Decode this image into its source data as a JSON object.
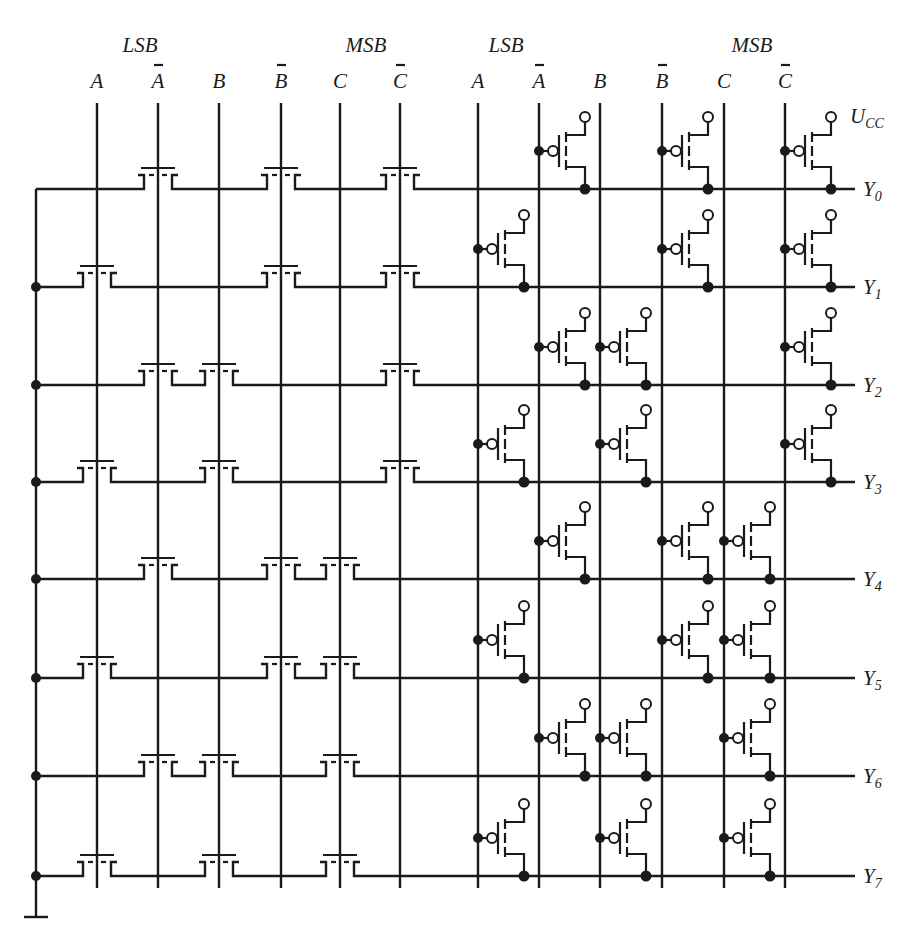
{
  "groups": [
    {
      "label": "LSB",
      "x": 140
    },
    {
      "label": "MSB",
      "x": 366
    },
    {
      "label": "LSB",
      "x": 506
    },
    {
      "label": "MSB",
      "x": 752
    }
  ],
  "columns_left": [
    {
      "label": "A",
      "bar": false,
      "x": 97
    },
    {
      "label": "A",
      "bar": true,
      "x": 158
    },
    {
      "label": "B",
      "bar": false,
      "x": 219
    },
    {
      "label": "B",
      "bar": true,
      "x": 281
    },
    {
      "label": "C",
      "bar": false,
      "x": 340
    },
    {
      "label": "C",
      "bar": true,
      "x": 400
    }
  ],
  "columns_right": [
    {
      "label": "A",
      "bar": false,
      "x": 478
    },
    {
      "label": "A",
      "bar": true,
      "x": 539
    },
    {
      "label": "B",
      "bar": false,
      "x": 600
    },
    {
      "label": "B",
      "bar": true,
      "x": 662
    },
    {
      "label": "C",
      "bar": false,
      "x": 724
    },
    {
      "label": "C",
      "bar": true,
      "x": 785
    }
  ],
  "supply": {
    "label": "U",
    "subscript": "CC"
  },
  "outputs": [
    {
      "label": "Y",
      "subscript": "0",
      "y": 189,
      "nmos": [
        1,
        3,
        5
      ],
      "pmos": [
        1,
        3,
        5
      ]
    },
    {
      "label": "Y",
      "subscript": "1",
      "y": 287,
      "nmos": [
        0,
        3,
        5
      ],
      "pmos": [
        0,
        3,
        5
      ]
    },
    {
      "label": "Y",
      "subscript": "2",
      "y": 385,
      "nmos": [
        1,
        2,
        5
      ],
      "pmos": [
        1,
        2,
        5
      ]
    },
    {
      "label": "Y",
      "subscript": "3",
      "y": 482,
      "nmos": [
        0,
        2,
        5
      ],
      "pmos": [
        0,
        2,
        5
      ]
    },
    {
      "label": "Y",
      "subscript": "4",
      "y": 579,
      "nmos": [
        1,
        3,
        4
      ],
      "pmos": [
        1,
        3,
        4
      ]
    },
    {
      "label": "Y",
      "subscript": "5",
      "y": 678,
      "nmos": [
        0,
        3,
        4
      ],
      "pmos": [
        0,
        3,
        4
      ]
    },
    {
      "label": "Y",
      "subscript": "6",
      "y": 776,
      "nmos": [
        1,
        2,
        4
      ],
      "pmos": [
        1,
        2,
        4
      ]
    },
    {
      "label": "Y",
      "subscript": "7",
      "y": 876,
      "nmos": [
        0,
        2,
        4
      ],
      "pmos": [
        0,
        2,
        4
      ]
    }
  ],
  "ground_bus_x": 36,
  "colors": {
    "ink": "#1a1a1a",
    "background": "#ffffff"
  }
}
